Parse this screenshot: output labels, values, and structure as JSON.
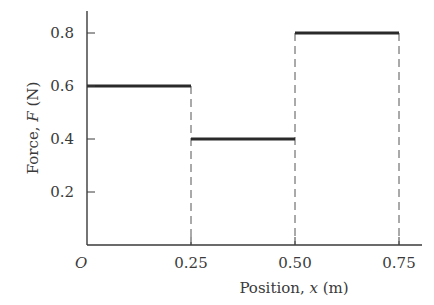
{
  "chart_data": {
    "type": "line",
    "subtype": "step",
    "title": "",
    "xlabel": "Position, x (m)",
    "ylabel": "Force, F (N)",
    "xlim": [
      0,
      0.8
    ],
    "ylim": [
      0,
      0.9
    ],
    "x_ticks": [
      0.25,
      0.5,
      0.75
    ],
    "x_tick_labels": [
      "0.25",
      "0.50",
      "0.75"
    ],
    "y_ticks": [
      0.2,
      0.4,
      0.6,
      0.8
    ],
    "y_tick_labels": [
      "0.2",
      "0.4",
      "0.6",
      "0.8"
    ],
    "origin_label": "O",
    "grid": false,
    "legend": null,
    "segments": [
      {
        "x_start": 0.0,
        "x_end": 0.25,
        "y": 0.6
      },
      {
        "x_start": 0.25,
        "x_end": 0.5,
        "y": 0.4
      },
      {
        "x_start": 0.5,
        "x_end": 0.75,
        "y": 0.8
      }
    ],
    "dashed_verticals": [
      {
        "x": 0.25,
        "y_top": 0.6
      },
      {
        "x": 0.5,
        "y_top": 0.8
      },
      {
        "x": 0.75,
        "y_top": 0.8
      }
    ]
  },
  "labels": {
    "ylabel_prefix": "Force, ",
    "ylabel_var": "F",
    "ylabel_unit": " (N)",
    "xlabel_prefix": "Position, ",
    "xlabel_var": "x",
    "xlabel_unit": " (m)",
    "origin": "O"
  },
  "colors": {
    "line": "#2a2a2a",
    "axis": "#3a3a3a",
    "dash": "#555555",
    "text": "#3a3a3a"
  }
}
